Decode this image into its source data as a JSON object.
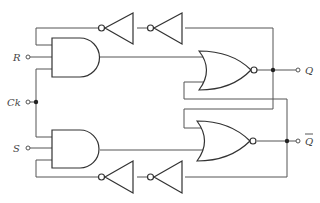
{
  "diagram": {
    "title": "",
    "type": "logic-circuit",
    "inputs": [
      {
        "id": "R",
        "label": "R"
      },
      {
        "id": "Ck",
        "label": "Ck"
      },
      {
        "id": "S",
        "label": "S"
      }
    ],
    "outputs": [
      {
        "id": "Q",
        "label": "Q"
      },
      {
        "id": "Qbar",
        "label": "Q̅"
      }
    ],
    "gates": [
      {
        "id": "and-top",
        "type": "AND",
        "inputs": [
          "top-feedback",
          "R",
          "Ck"
        ]
      },
      {
        "id": "and-bottom",
        "type": "AND",
        "inputs": [
          "Ck",
          "S",
          "bottom-feedback"
        ]
      },
      {
        "id": "nor-top",
        "type": "NOR",
        "inputs": [
          "and-top",
          "Qbar"
        ],
        "output": "Q"
      },
      {
        "id": "nor-bottom",
        "type": "NOR",
        "inputs": [
          "Q",
          "and-bottom"
        ],
        "output": "Qbar"
      },
      {
        "id": "inv-top-1",
        "type": "NOT"
      },
      {
        "id": "inv-top-2",
        "type": "NOT"
      },
      {
        "id": "inv-bottom-1",
        "type": "NOT"
      },
      {
        "id": "inv-bottom-2",
        "type": "NOT"
      }
    ],
    "colors": {
      "line": "#555555",
      "background": "#ffffff"
    }
  },
  "labels": {
    "r": "R",
    "ck": "Ck",
    "s": "S",
    "q": "Q",
    "qbar": "Q"
  }
}
